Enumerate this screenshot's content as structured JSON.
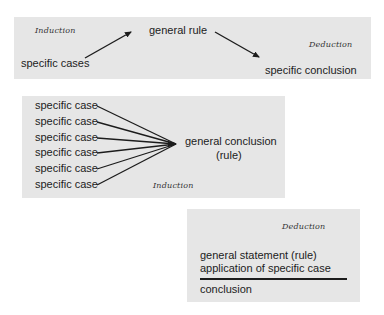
{
  "panel_top": {
    "induction_label": "Induction",
    "deduction_label": "Deduction",
    "specific_cases": "specific cases",
    "general_rule": "general rule",
    "specific_conclusion": "specific conclusion"
  },
  "panel_induction": {
    "cases": [
      "specific case",
      "specific case",
      "specific case",
      "specific case",
      "specific case",
      "specific case"
    ],
    "conclusion_line1": "general conclusion",
    "conclusion_line2": "(rule)",
    "label": "Induction"
  },
  "panel_deduction": {
    "label": "Deduction",
    "premise1": "general statement (rule)",
    "premise2": "application of specific case",
    "conclusion": "conclusion"
  },
  "colors": {
    "panel_bg": "#e6e6e6",
    "ink": "#1c1c1c"
  }
}
